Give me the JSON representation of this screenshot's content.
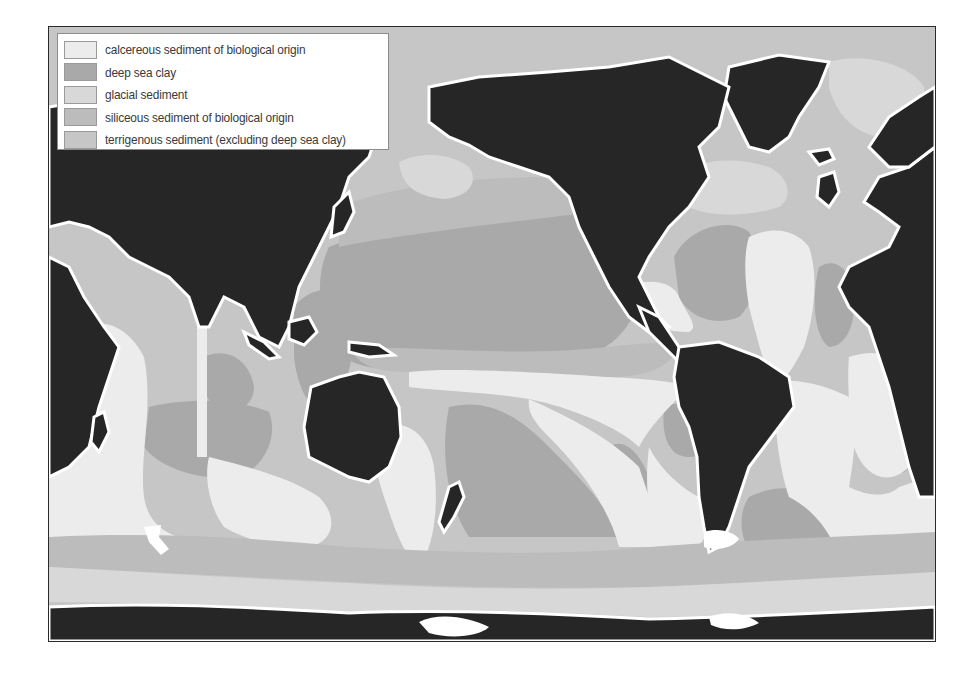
{
  "map": {
    "title": "",
    "legend": [
      {
        "label": "calcereous sediment of biological origin",
        "color": "#ececec"
      },
      {
        "label": "deep sea clay",
        "color": "#a9a9a9"
      },
      {
        "label": "glacial sediment",
        "color": "#d8d8d8"
      },
      {
        "label": "siliceous sediment of biological origin",
        "color": "#bcbcbc"
      },
      {
        "label": "terrigenous sediment (excluding deep sea clay)",
        "color": "#c6c6c6"
      }
    ],
    "colors": {
      "land": "#262626",
      "coast": "#ffffff",
      "calcareous": "#ececec",
      "deep_sea_clay": "#a9a9a9",
      "glacial": "#d8d8d8",
      "siliceous": "#bcbcbc",
      "terrigenous": "#c6c6c6"
    }
  }
}
